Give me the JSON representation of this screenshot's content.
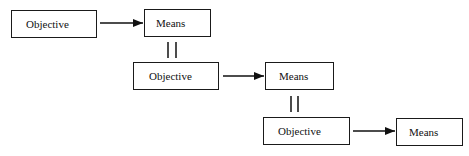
{
  "diagram": {
    "type": "objective-means hierarchy",
    "levels": [
      {
        "objective": "Objective",
        "means": "Means"
      },
      {
        "objective": "Objective",
        "means": "Means"
      },
      {
        "objective": "Objective",
        "means": "Means"
      }
    ],
    "relations": [
      {
        "from": "level1.objective",
        "to": "level1.means",
        "kind": "arrow"
      },
      {
        "from": "level1.means",
        "to": "level2.objective",
        "kind": "equals"
      },
      {
        "from": "level2.objective",
        "to": "level2.means",
        "kind": "arrow"
      },
      {
        "from": "level2.means",
        "to": "level3.objective",
        "kind": "equals"
      },
      {
        "from": "level3.objective",
        "to": "level3.means",
        "kind": "arrow"
      }
    ],
    "colors": {
      "stroke": "#1a1a1a",
      "background": "#ffffff"
    }
  }
}
